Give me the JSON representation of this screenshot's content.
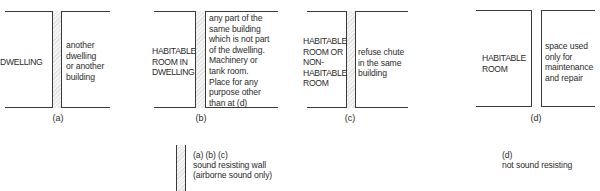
{
  "panels": [
    {
      "id": "a",
      "left_label": "DWELLING",
      "right_label": "another\ndwelling\nor another\nbuilding",
      "caption": "(a)",
      "wall_type": "sound resisting"
    },
    {
      "id": "b",
      "left_label": "HABITABLE\nROOM IN\nDWELLING",
      "right_label": "any part of the\nsame building\nwhich is not part\nof the dwelling.\nMachinery or\ntank room.\nPlace for any\npurpose other\nthan at (d)",
      "caption": "(b)",
      "wall_type": "sound resisting"
    },
    {
      "id": "c",
      "left_label": "HABITABLE\nROOM OR\nNON-\nHABITABLE\nROOM",
      "right_label": "refuse chute\nin the same\nbuilding",
      "caption": "(c)",
      "wall_type": "sound resisting"
    },
    {
      "id": "d",
      "left_label": "HABITABLE\nROOM",
      "right_label": "space used\nonly for\nmaintenance\nand repair",
      "caption": "(d)",
      "wall_type": "not sound resisting"
    }
  ],
  "legend": {
    "sound_resisting": {
      "refs": "(a) (b) (c)",
      "line1": "sound resisting wall",
      "line2": "(airborne sound only)"
    },
    "not_sound_resisting": {
      "refs": "(d)",
      "line1": "not sound resisting"
    }
  },
  "colors": {
    "line": "#3a3a3a",
    "wall_fill": "#e8e8e8",
    "text": "#2b2b2b"
  }
}
